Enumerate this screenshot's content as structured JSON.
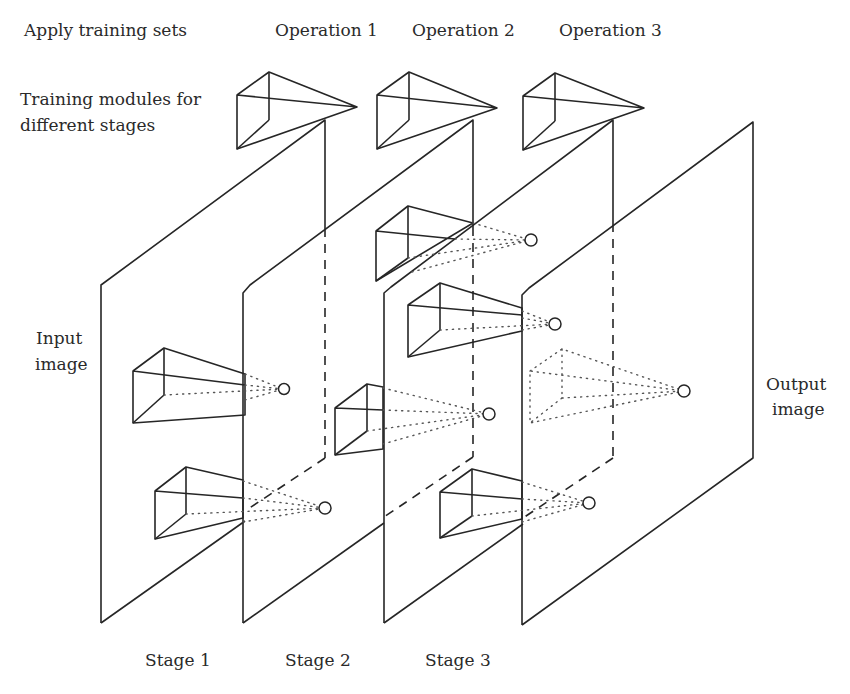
{
  "labels": {
    "apply_training_sets": "Apply training sets",
    "operations": [
      "Operation 1",
      "Operation 2",
      "Operation 3"
    ],
    "training_modules_line1": "Training modules for",
    "training_modules_line2": "different stages",
    "input_line1": "Input",
    "input_line2": "image",
    "output_line1": "Output",
    "output_line2": "image",
    "stages": [
      "Stage 1",
      "Stage 2",
      "Stage 3"
    ]
  },
  "diagram": {
    "planes": [
      {
        "name": "input-image-plane",
        "index": 1
      },
      {
        "name": "stage-2-plane",
        "index": 2
      },
      {
        "name": "stage-3-plane",
        "index": 3
      },
      {
        "name": "output-image-plane",
        "index": 4
      }
    ],
    "training_modules_top": [
      "Operation 1",
      "Operation 2",
      "Operation 3"
    ],
    "colors": {
      "line": "#262626",
      "background": "#ffffff"
    }
  }
}
